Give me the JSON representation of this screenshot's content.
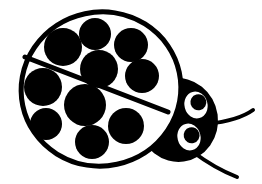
{
  "artwork": {
    "title": "Ladybug",
    "style": "black-and-white line art clipart",
    "subject": "ladybug-beetle",
    "orientation": "three-quarter view facing lower-right",
    "canvas": {
      "width": 262,
      "height": 184
    },
    "colors": {
      "background": "#ffffff",
      "ink": "#000000",
      "eye_white": "#ffffff",
      "pupil": "#000000"
    }
  },
  "figure": {
    "body": {
      "name": "elytra-shell",
      "shape": "ellipse",
      "cx": 101,
      "cy": 89,
      "rx": 80,
      "ry": 77,
      "rotation": -12,
      "fill": "#ffffff",
      "stroke": "#000000",
      "stroke_width": 5
    },
    "wing_divider": {
      "name": "elytra-seam",
      "x1": 25,
      "y1": 57,
      "x2": 168,
      "y2": 112,
      "stroke": "#000000",
      "stroke_width": 5
    },
    "spots": [
      {
        "id": 1,
        "cx": 63,
        "cy": 47,
        "r": 19,
        "wing": "upper"
      },
      {
        "id": 2,
        "cx": 95,
        "cy": 34,
        "r": 16,
        "wing": "upper"
      },
      {
        "id": 3,
        "cx": 131,
        "cy": 45,
        "r": 17,
        "wing": "upper"
      },
      {
        "id": 4,
        "cx": 99,
        "cy": 69,
        "r": 19,
        "wing": "upper"
      },
      {
        "id": 5,
        "cx": 142,
        "cy": 76,
        "r": 17,
        "wing": "upper"
      },
      {
        "id": 6,
        "cx": 43,
        "cy": 87,
        "r": 19,
        "wing": "lower"
      },
      {
        "id": 7,
        "cx": 85,
        "cy": 105,
        "r": 21,
        "wing": "lower"
      },
      {
        "id": 8,
        "cx": 46,
        "cy": 124,
        "r": 16,
        "wing": "lower"
      },
      {
        "id": 9,
        "cx": 92,
        "cy": 142,
        "r": 17,
        "wing": "lower"
      },
      {
        "id": 10,
        "cx": 126,
        "cy": 126,
        "r": 18,
        "wing": "lower"
      }
    ],
    "head": {
      "name": "head",
      "shape": "ellipse",
      "cx": 178,
      "cy": 120,
      "rx": 40,
      "ry": 42,
      "rotation": -8,
      "fill": "#000000"
    },
    "eyes": [
      {
        "id": "upper-right-eye",
        "cx": 196,
        "cy": 105,
        "rx": 13,
        "ry": 15,
        "rotation": -15,
        "fill": "#ffffff",
        "stroke": "#000000",
        "pupil": {
          "cx": 199,
          "cy": 103,
          "r": 8,
          "fill": "#000000"
        }
      },
      {
        "id": "lower-right-eye",
        "cx": 189,
        "cy": 137,
        "rx": 13,
        "ry": 15,
        "rotation": -15,
        "fill": "#ffffff",
        "stroke": "#000000",
        "pupil": {
          "cx": 192,
          "cy": 136,
          "r": 8,
          "fill": "#000000"
        }
      }
    ],
    "antennae": [
      {
        "id": "upper-antenna",
        "path": "M 207 124 C 225 122 242 118 253 110",
        "stroke": "#000000",
        "stroke_width": 4
      },
      {
        "id": "lower-antenna",
        "path": "M 193 152 C 205 161 219 170 237 177",
        "stroke": "#000000",
        "stroke_width": 4
      }
    ]
  },
  "counts": {
    "spots_total": 10,
    "eyes": 2,
    "antennae": 2
  }
}
